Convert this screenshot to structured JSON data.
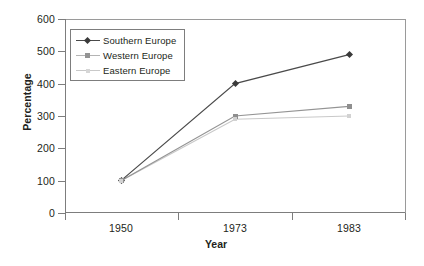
{
  "chart_data": {
    "type": "line",
    "title": "",
    "xlabel": "Year",
    "ylabel": "Percentage",
    "categories": [
      "1950",
      "1973",
      "1983"
    ],
    "x": [
      1950,
      1973,
      1983
    ],
    "xlim": [
      1950,
      1983
    ],
    "ylim": [
      0,
      600
    ],
    "yticks": [
      0,
      100,
      200,
      300,
      400,
      500,
      600
    ],
    "ytick_labels": [
      "0",
      "100",
      "200",
      "300",
      "400",
      "500",
      "600"
    ],
    "xtick_labels": [
      "1950",
      "1973",
      "1983"
    ],
    "grid": false,
    "legend_position": "upper-left-inside",
    "series": [
      {
        "name": "Southern Europe",
        "values": [
          100,
          400,
          490
        ],
        "color": "#4a4a4a",
        "marker": "diamond"
      },
      {
        "name": "Western Europe",
        "values": [
          100,
          300,
          330
        ],
        "color": "#949494",
        "marker": "square"
      },
      {
        "name": "Eastern Europe",
        "values": [
          100,
          290,
          300
        ],
        "color": "#c9c9c9",
        "marker": "small-square"
      }
    ]
  },
  "axes": {
    "y_title": "Percentage",
    "x_title": "Year",
    "y_labels": [
      "600",
      "500",
      "400",
      "300",
      "200",
      "100",
      "0"
    ],
    "x_labels": [
      "1950",
      "1973",
      "1983"
    ]
  },
  "legend": {
    "items": [
      {
        "label": "Southern Europe"
      },
      {
        "label": "Western Europe"
      },
      {
        "label": "Eastern Europe"
      }
    ]
  },
  "colors": {
    "southern": "#4a4a4a",
    "western": "#949494",
    "eastern": "#c9c9c9",
    "axis": "#7d7d7d",
    "text": "#231f20",
    "background": "#ffffff"
  }
}
